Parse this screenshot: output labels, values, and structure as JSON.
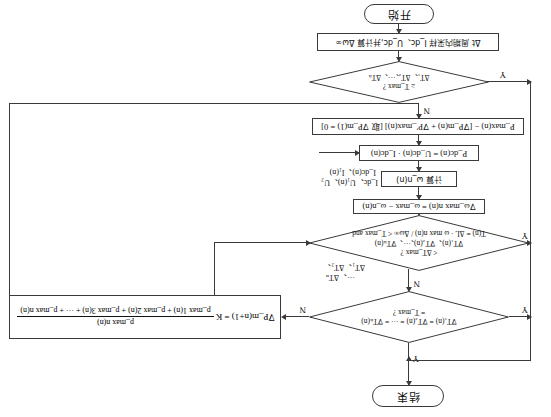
{
  "diagram": {
    "orientation": "rotated-180",
    "stroke_color": "#3a3a3a",
    "background_color": "#ffffff"
  },
  "nodes": {
    "end_terminal": {
      "label": "结束",
      "shape": "terminal"
    },
    "start_terminal": {
      "label": "开始",
      "shape": "terminal"
    },
    "sample_process": {
      "label": "Δt 周期内采样 I_dc、U_dc,并计算 Δω∞",
      "shape": "process"
    },
    "pmax_process": {
      "label": "P_max(n) − [∇P_m(n) + ∇P′_max(n)] [取 ∇P_m(1) = 0]",
      "shape": "process"
    },
    "pdc_process": {
      "label": "P_dc(n) = U_dc(n) · I_dc(n)",
      "shape": "process"
    },
    "omega_calc_process": {
      "label": "计算 ω_n(n)",
      "shape": "process"
    },
    "grad_omega_process": {
      "label": "∇ω_max n(n) = ω_max − ω_n(n)",
      "shape": "process"
    },
    "decision_bottom": {
      "line1": "ΔT₁、ΔT₂、···、ΔTₙ",
      "line2": "≥ T_max ?",
      "shape": "decision"
    },
    "decision_middle": {
      "line1": "T(n) = ΔL · ω max n(n) / Δω∞ < T_max and",
      "line2": "∇T₁(n)、∇T₂(n)、···、∇Tₙ(n)",
      "line3": "< ΔT_max ?",
      "shape": "decision"
    },
    "decision_top": {
      "line1": "∇T₁(n) = ∇T₂(n) = ··· = ∇Tₙ(n)",
      "line2": "= T_max ?",
      "shape": "decision"
    },
    "gradient_formula_box": {
      "lhs": "∇P_m(n+1) = K",
      "numerator": "p_max n(n)",
      "denominator": "p_max 1(n) + p_max 2(n) + p_max 3(n) + ··· + p_max n(n)",
      "shape": "formula"
    }
  },
  "labels": {
    "side_inputs_line1": "I_dc(n)、I₁(n)",
    "side_inputs_line2": "I_dc、U₁(n)、U₂",
    "side_deltaT_line1": "ΔT₁、ΔT₂、",
    "side_deltaT_line2": "···、ΔTₙ"
  },
  "branches": {
    "bottom_decision_yes": "Y",
    "bottom_decision_no": "N",
    "middle_decision_yes": "Y",
    "middle_decision_no": "N",
    "top_decision_yes": "Y",
    "top_decision_no": "N"
  }
}
